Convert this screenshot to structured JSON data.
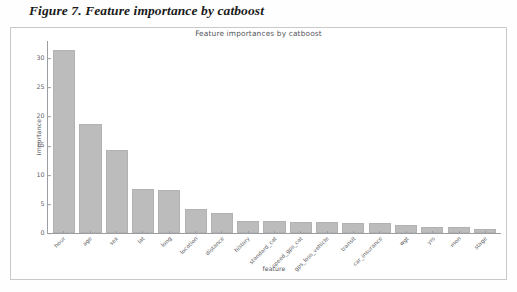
{
  "caption": "Figure 7. Feature importance by catboost",
  "chart_data": {
    "type": "bar",
    "title": "Feature importances by catboost",
    "xlabel": "feature",
    "ylabel": "importance",
    "ylim": [
      0,
      33
    ],
    "yticks": [
      "0",
      "5",
      "10",
      "15",
      "20",
      "25",
      "30"
    ],
    "grid": false,
    "legend": null,
    "bar_color": "#bcbcbc",
    "categories": [
      "hour",
      "age",
      "sex",
      "lat",
      "long",
      "location",
      "distance",
      "history",
      "standard_cat",
      "speed_gps_cat",
      "gps_loss_vehicle",
      "transit",
      "car_insurance",
      "wgt",
      "yrs",
      "mon",
      "stage"
    ],
    "values": [
      31.5,
      18.8,
      14.2,
      7.5,
      7.4,
      4.2,
      3.5,
      2.1,
      2.0,
      1.9,
      1.85,
      1.8,
      1.75,
      1.4,
      1.1,
      0.95,
      0.7
    ]
  }
}
